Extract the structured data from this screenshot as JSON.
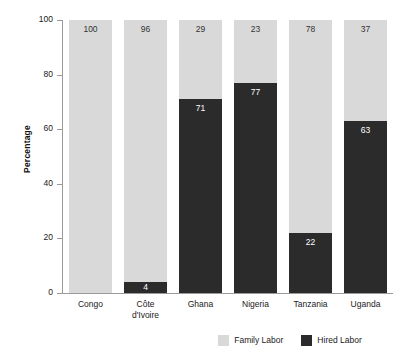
{
  "chart_data": {
    "type": "bar",
    "subtype": "stacked-bar",
    "title": "",
    "subtitle": "",
    "xlabel": "",
    "ylabel": "Percentage",
    "ylim": [
      0,
      100
    ],
    "yticks": [
      0,
      20,
      40,
      60,
      80,
      100
    ],
    "ytick_labels": [
      "0",
      "20",
      "40",
      "60",
      "80",
      "100"
    ],
    "grid": false,
    "legend_position": "bottom-right",
    "categories": [
      "Congo",
      "Côte d'Ivoire",
      "Ghana",
      "Nigeria",
      "Tanzania",
      "Uganda"
    ],
    "category_lines": [
      [
        "Congo"
      ],
      [
        "Côte",
        "d'Ivoire"
      ],
      [
        "Ghana"
      ],
      [
        "Nigeria"
      ],
      [
        "Tanzania"
      ],
      [
        "Uganda"
      ]
    ],
    "series": [
      {
        "name": "Family Labor",
        "color": "#d9d9d9",
        "values": [
          100,
          96,
          29,
          23,
          78,
          37
        ]
      },
      {
        "name": "Hired Labor",
        "color": "#2b2b2b",
        "values": [
          0,
          4,
          71,
          77,
          22,
          63
        ]
      }
    ],
    "value_labels": {
      "family": [
        "100",
        "96",
        "29",
        "23",
        "78",
        "37"
      ],
      "hired": [
        "",
        "4",
        "71",
        "77",
        "22",
        "63"
      ]
    }
  },
  "axis": {
    "y_title": "Percentage"
  },
  "legend": {
    "items": [
      {
        "label": "Family Labor",
        "color": "#d9d9d9"
      },
      {
        "label": "Hired Labor",
        "color": "#2b2b2b"
      }
    ]
  },
  "colors": {
    "family_labor": "#d9d9d9",
    "hired_labor": "#2b2b2b",
    "axis": "#9a9a9a",
    "text": "#1a1a1a",
    "background": "#ffffff"
  }
}
